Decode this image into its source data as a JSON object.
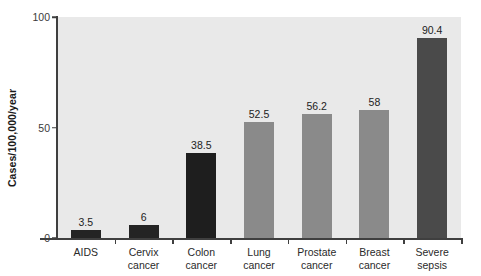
{
  "chart_data": {
    "type": "bar",
    "title": "",
    "subtitle": "",
    "xlabel": "",
    "ylabel": "Cases/100,000/year",
    "ylim": [
      0,
      100
    ],
    "yticks": [
      0,
      50,
      100
    ],
    "ytick_labels": [
      "0",
      "50",
      "100"
    ],
    "grid": false,
    "legend": null,
    "categories": [
      "AIDS",
      "Cervix cancer",
      "Colon cancer",
      "Lung cancer",
      "Prostate cancer",
      "Breast cancer",
      "Severe sepsis"
    ],
    "category_lines": [
      [
        "AIDS",
        ""
      ],
      [
        "Cervix",
        "cancer"
      ],
      [
        "Colon",
        "cancer"
      ],
      [
        "Lung",
        "cancer"
      ],
      [
        "Prostate",
        "cancer"
      ],
      [
        "Breast",
        "cancer"
      ],
      [
        "Severe",
        "sepsis"
      ]
    ],
    "values": [
      3.5,
      6,
      38.5,
      52.5,
      56.2,
      58,
      90.4
    ],
    "value_labels": [
      "3.5",
      "6",
      "38.5",
      "52.5",
      "56.2",
      "58",
      "90.4"
    ],
    "bar_colors": [
      "#242424",
      "#242424",
      "#1e1e1e",
      "#8a8a8a",
      "#8a8a8a",
      "#8a8a8a",
      "#4a4a4a"
    ]
  },
  "style": {
    "plot_background": "#e9e9e9",
    "page_background": "#ffffff",
    "axis_color": "#3f3f3f",
    "text_color": "#222222"
  }
}
